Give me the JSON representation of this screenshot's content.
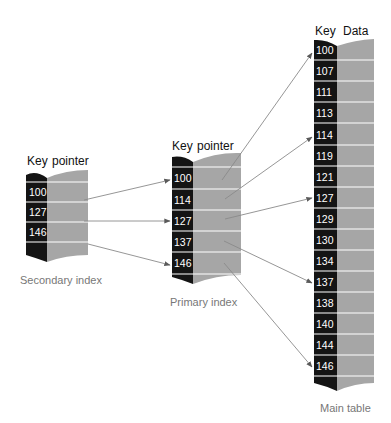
{
  "diagram": {
    "colors": {
      "key_column": "#141414",
      "data_column": "#a6a6a6",
      "row_divider": "#ffffff",
      "arrow": "#8a8a8a",
      "caption": "#777777",
      "header": "#111111"
    },
    "secondary_index": {
      "header_key": "Key",
      "header_value": "pointer",
      "caption": "Secondary index",
      "keys": [
        "100",
        "127",
        "146"
      ]
    },
    "primary_index": {
      "header_key": "Key",
      "header_value": "pointer",
      "caption": "Primary index",
      "keys": [
        "100",
        "114",
        "127",
        "137",
        "146"
      ]
    },
    "main_table": {
      "header_key": "Key",
      "header_value": "Data",
      "caption": "Main table",
      "keys": [
        "100",
        "107",
        "111",
        "113",
        "114",
        "119",
        "121",
        "127",
        "129",
        "130",
        "134",
        "137",
        "138",
        "140",
        "144",
        "146"
      ]
    },
    "links": [
      {
        "from": "secondary_index",
        "from_key": "100",
        "to": "primary_index",
        "to_key": "100"
      },
      {
        "from": "secondary_index",
        "from_key": "127",
        "to": "primary_index",
        "to_key": "127"
      },
      {
        "from": "secondary_index",
        "from_key": "146",
        "to": "primary_index",
        "to_key": "146"
      },
      {
        "from": "primary_index",
        "from_key": "100",
        "to": "main_table",
        "to_key": "100"
      },
      {
        "from": "primary_index",
        "from_key": "114",
        "to": "main_table",
        "to_key": "114"
      },
      {
        "from": "primary_index",
        "from_key": "127",
        "to": "main_table",
        "to_key": "127"
      },
      {
        "from": "primary_index",
        "from_key": "137",
        "to": "main_table",
        "to_key": "137"
      },
      {
        "from": "primary_index",
        "from_key": "146",
        "to": "main_table",
        "to_key": "146"
      }
    ]
  }
}
